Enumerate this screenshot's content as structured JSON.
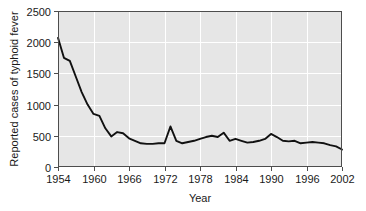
{
  "chart_data": {
    "type": "line",
    "title": "",
    "xlabel": "Year",
    "ylabel": "Reported cases of typhoid fever",
    "xlim": [
      1954,
      2002
    ],
    "ylim": [
      0,
      2500
    ],
    "xticks": [
      1954,
      1960,
      1966,
      1972,
      1978,
      1984,
      1990,
      1996,
      2002
    ],
    "yticks": [
      0,
      500,
      1000,
      1500,
      2000,
      2500
    ],
    "grid": true,
    "legend": null,
    "line_color": "#111111",
    "plot_background": "#e6e6e6",
    "gridline_color": "#ffffff",
    "series": [
      {
        "name": "Reported cases of typhoid fever",
        "x": [
          1954,
          1955,
          1956,
          1957,
          1958,
          1959,
          1960,
          1961,
          1962,
          1963,
          1964,
          1965,
          1966,
          1967,
          1968,
          1969,
          1970,
          1971,
          1972,
          1973,
          1974,
          1975,
          1976,
          1977,
          1978,
          1979,
          1980,
          1981,
          1982,
          1983,
          1984,
          1985,
          1986,
          1987,
          1988,
          1989,
          1990,
          1991,
          1992,
          1993,
          1994,
          1995,
          1996,
          1997,
          1998,
          1999,
          2000,
          2001,
          2002
        ],
        "values": [
          2070,
          1750,
          1700,
          1450,
          1200,
          1000,
          850,
          820,
          620,
          490,
          560,
          540,
          460,
          420,
          380,
          370,
          370,
          380,
          380,
          650,
          420,
          380,
          400,
          420,
          450,
          480,
          500,
          480,
          550,
          420,
          450,
          420,
          390,
          400,
          420,
          450,
          530,
          480,
          420,
          410,
          420,
          380,
          390,
          400,
          390,
          380,
          350,
          330,
          280
        ]
      }
    ]
  }
}
